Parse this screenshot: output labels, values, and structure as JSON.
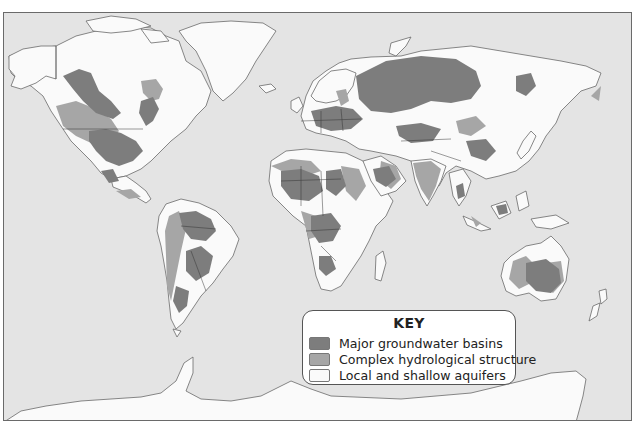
{
  "map": {
    "title": "World groundwater resources",
    "colors": {
      "ocean": "#e4e4e4",
      "major_basins": "#7d7d7d",
      "complex_structure": "#a6a6a6",
      "local_shallow": "#fafafa",
      "outline": "#555555"
    }
  },
  "legend": {
    "title": "KEY",
    "items": [
      {
        "label": "Major groundwater basins",
        "color": "#7d7d7d"
      },
      {
        "label": "Complex hydrological structure",
        "color": "#a6a6a6"
      },
      {
        "label": "Local and shallow aquifers",
        "color": "#fafafa"
      }
    ]
  }
}
